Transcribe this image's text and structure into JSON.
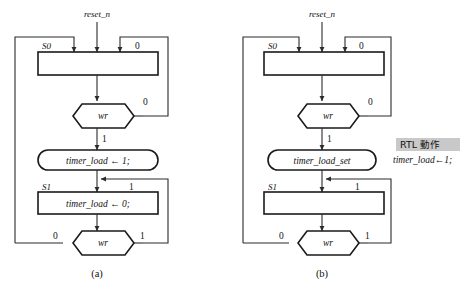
{
  "figure": {
    "background_color": "#ffffff",
    "line_color": "#2b2b2b",
    "shape_stroke_color": "#1a1a1a",
    "highlight_color": "#c9c9c9",
    "captions": [
      {
        "id": "a",
        "text": "(a)"
      },
      {
        "id": "b",
        "text": "(b)"
      }
    ]
  },
  "panel_a": {
    "caption": "(a)",
    "input_signal": "reset_n",
    "states": [
      {
        "name": "S0",
        "label": "S0",
        "body": ""
      },
      {
        "name": "S1",
        "label": "S1",
        "body": "timer_load ← 0;"
      }
    ],
    "action_box": "timer_load ← 1;",
    "decisions": [
      {
        "name": "wr-top",
        "label": "wr",
        "branch_right": "0",
        "branch_down": "1"
      },
      {
        "name": "wr-bottom",
        "label": "wr",
        "branch_left": "0",
        "branch_right": "1"
      }
    ],
    "edge_labels": {
      "s0_right": "0",
      "wr_top_right": "0",
      "wr_top_down": "1",
      "s1_right": "1",
      "wr_bottom_left": "0",
      "wr_bottom_right": "1"
    }
  },
  "panel_b": {
    "caption": "(b)",
    "input_signal": "reset_n",
    "states": [
      {
        "name": "S0",
        "label": "S0",
        "body": ""
      },
      {
        "name": "S1",
        "label": "S1",
        "body": ""
      }
    ],
    "action_box": "timer_load_set",
    "decisions": [
      {
        "name": "wr-top",
        "label": "wr",
        "branch_right": "0",
        "branch_down": "1"
      },
      {
        "name": "wr-bottom",
        "label": "wr",
        "branch_left": "0",
        "branch_right": "1"
      }
    ],
    "edge_labels": {
      "s0_right": "0",
      "wr_top_right": "0",
      "wr_top_down": "1",
      "s1_right": "1",
      "wr_bottom_left": "0",
      "wr_bottom_right": "1"
    },
    "annotation": {
      "title": "RTL 動作",
      "body": "timer_load←1;"
    }
  }
}
